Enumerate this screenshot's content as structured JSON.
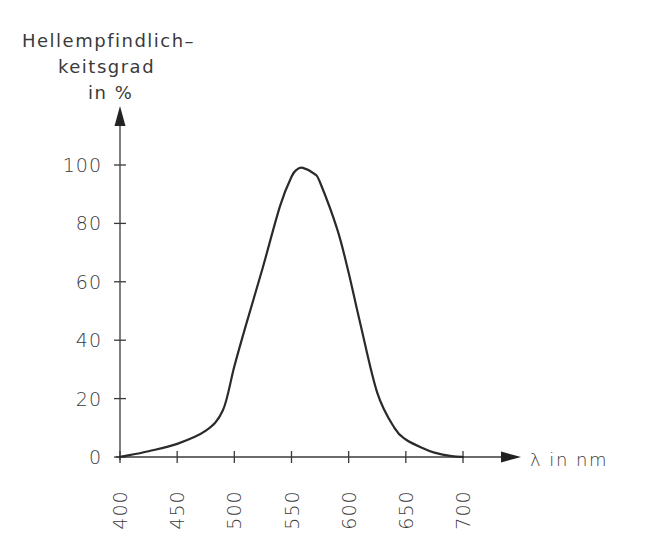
{
  "chart_data": {
    "type": "line",
    "title": "",
    "ylabel": [
      "Hellempfindlich–",
      "keitsgrad",
      "in %"
    ],
    "xlabel": "λ in nm",
    "xlim": [
      400,
      700
    ],
    "ylim": [
      0,
      100
    ],
    "xticks": [
      400,
      450,
      500,
      550,
      600,
      650,
      700
    ],
    "yticks": [
      0,
      20,
      40,
      60,
      80,
      100
    ],
    "grid": false,
    "legend": null,
    "series": [
      {
        "name": "Hellempfindlichkeitsgrad",
        "x": [
          400,
          425,
          450,
          475,
          490,
          500,
          510,
          525,
          540,
          550,
          555,
          560,
          570,
          575,
          590,
          600,
          610,
          625,
          640,
          650,
          665,
          675,
          690,
          700
        ],
        "y": [
          0,
          2,
          4.5,
          9,
          16,
          31,
          45,
          65,
          86,
          96,
          98.5,
          99,
          97,
          94,
          78,
          63,
          46,
          22,
          10,
          6,
          3,
          1.5,
          0.3,
          0
        ]
      }
    ]
  }
}
